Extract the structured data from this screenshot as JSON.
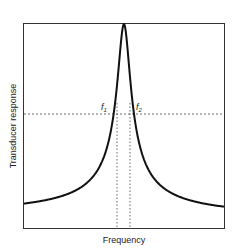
{
  "chart_data": {
    "type": "line",
    "title": "",
    "xlabel": "Frequency",
    "ylabel": "Transducer response",
    "annotations": [
      {
        "label": "f",
        "sub": "1",
        "position": "left of peak, at half-power level"
      },
      {
        "label": "f",
        "sub": "2",
        "position": "right of peak, at half-power level"
      }
    ],
    "reference_lines": {
      "horizontal_dashed_level": 0.71,
      "vertical_dashed_at": [
        "f1",
        "f2"
      ]
    },
    "series": [
      {
        "name": "Resonance response",
        "x": [
          0.0,
          0.1,
          0.2,
          0.3,
          0.35,
          0.4,
          0.43,
          0.45,
          0.47,
          0.49,
          0.5,
          0.51,
          0.53,
          0.55,
          0.57,
          0.6,
          0.65,
          0.7,
          0.8,
          0.9,
          1.0
        ],
        "values": [
          0.07,
          0.09,
          0.11,
          0.15,
          0.19,
          0.26,
          0.38,
          0.6,
          0.71,
          0.93,
          1.0,
          0.93,
          0.71,
          0.6,
          0.38,
          0.26,
          0.19,
          0.15,
          0.1,
          0.07,
          0.05
        ]
      }
    ],
    "xlim": [
      0,
      1
    ],
    "ylim": [
      0,
      1
    ],
    "grid": false,
    "legend": "none",
    "tick_labels": "none"
  }
}
